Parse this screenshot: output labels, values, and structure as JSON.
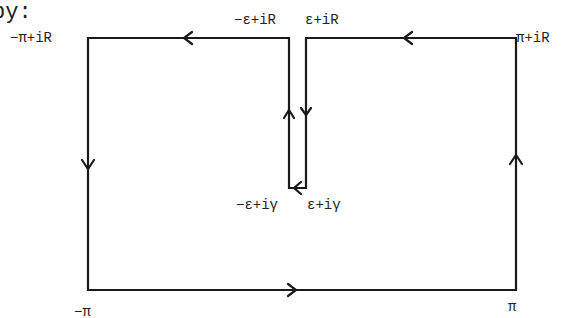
{
  "header": {
    "text": "by:"
  },
  "diagram": {
    "labels": {
      "top_left": "−π+iR",
      "top_slot_left": "−ε+iR",
      "top_slot_right": "ε+iR",
      "top_right": "π+iR",
      "bottom_slot_left": "−ε+iγ",
      "bottom_slot_right": "ε+iγ",
      "bottom_left": "−π",
      "bottom_right": "π"
    },
    "stroke_color": "#1a1a1a"
  }
}
